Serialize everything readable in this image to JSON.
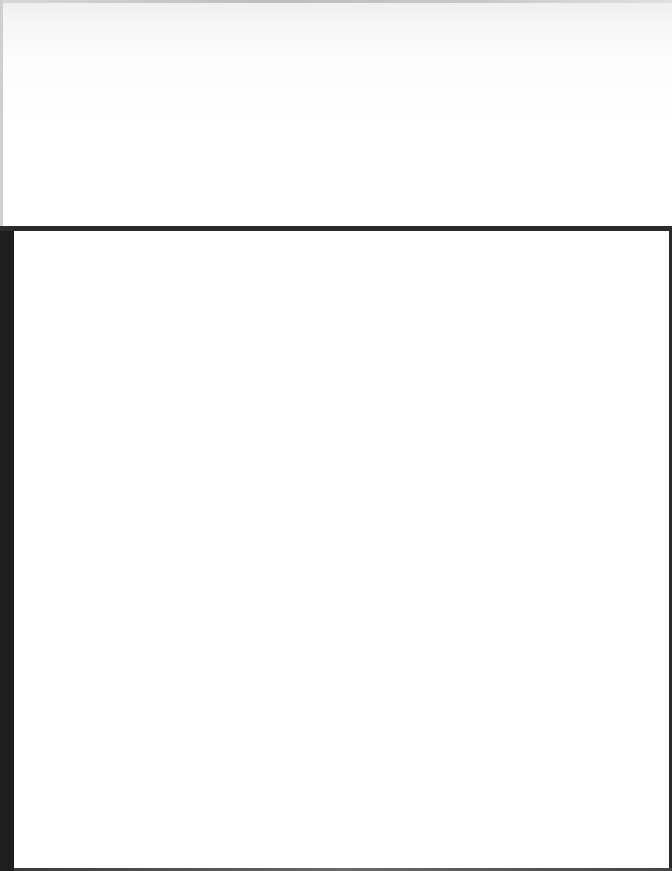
{
  "page": {
    "top_region": {
      "text": ""
    },
    "lower_region": {
      "text": ""
    }
  },
  "colors": {
    "background": "#ffffff",
    "rule": "#2b2b2b",
    "left_bar": "#1e1e1e",
    "top_fade": "#eeeeee"
  }
}
